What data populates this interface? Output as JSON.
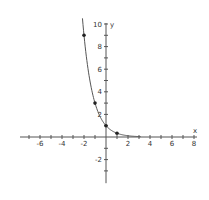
{
  "chart_data": {
    "type": "line",
    "title": "",
    "function": "y = (1/3)^x",
    "xlabel": "x",
    "ylabel": "y",
    "xlim": [
      -8,
      8
    ],
    "ylim": [
      -4,
      10
    ],
    "x_ticks": [
      -6,
      -4,
      -2,
      2,
      4,
      6,
      8
    ],
    "y_ticks": [
      -2,
      2,
      4,
      6,
      8,
      10
    ],
    "x_tick_labels": [
      "-6",
      "-4",
      "-2",
      "2",
      "4",
      "6",
      "8"
    ],
    "y_tick_labels": [
      "-2",
      "2",
      "4",
      "6",
      "8",
      "10"
    ],
    "grid": false,
    "points": [
      {
        "x": -2,
        "y": 9
      },
      {
        "x": -1,
        "y": 3
      },
      {
        "x": 0,
        "y": 1
      },
      {
        "x": 1,
        "y": 0.333
      }
    ],
    "curve_color": "#555555",
    "axis_color": "#555555"
  }
}
